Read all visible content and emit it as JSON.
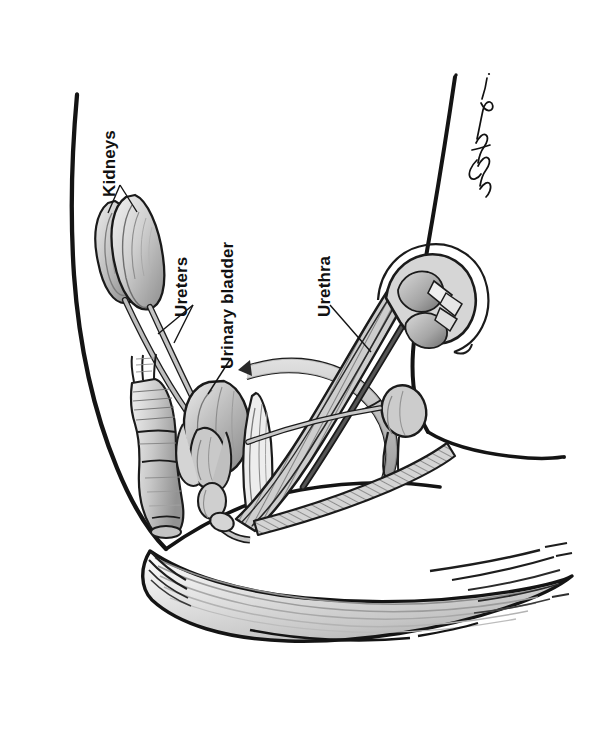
{
  "document": {
    "kind": "anatomical-illustration",
    "subject": "Male canine urinary tract, lateral view",
    "medium": "grayscale pen-and-ink with wash shading",
    "page_background_color": "#ffffff",
    "ink_color": "#111111",
    "scan_border_color": "#080808",
    "page_edge_line_color": "#b9b9b9"
  },
  "labels": [
    {
      "id": "kidneys",
      "text": "Kidneys",
      "rotation_degrees": -90,
      "x": 118,
      "y": 180,
      "font_size_px": 17,
      "leader": "double-branch-v"
    },
    {
      "id": "ureters",
      "text": "Ureters",
      "rotation_degrees": -90,
      "x": 190,
      "y": 300,
      "font_size_px": 17,
      "leader": "double-branch-v"
    },
    {
      "id": "urinary-bladder",
      "text": "Urinary bladder",
      "rotation_degrees": -90,
      "x": 236,
      "y": 352,
      "font_size_px": 17,
      "leader": "single-line"
    },
    {
      "id": "urethra",
      "text": "Urethra",
      "rotation_degrees": -90,
      "x": 333,
      "y": 300,
      "font_size_px": 17,
      "leader": "single-line"
    }
  ],
  "signature": {
    "present": true,
    "description": "handwritten artist signature, rotated, upper right",
    "x": 470,
    "y": 140
  },
  "anatomy_parts": [
    "left-kidney",
    "right-kidney",
    "left-ureter",
    "right-ureter",
    "urinary-bladder",
    "prostate",
    "urethra",
    "penis-shaft",
    "os-penis",
    "glans-penis",
    "bulbus-glandis",
    "testis",
    "body-outline-dorsal",
    "body-outline-ventral",
    "vertebral-column",
    "hindlimb-musculature",
    "tail-musculature"
  ],
  "palette": {
    "outline": "#121212",
    "tissue_light": "#e8e8e8",
    "tissue_mid": "#bdbdbd",
    "tissue_dark": "#8e8e8e",
    "tissue_deep": "#6a6a6a",
    "hatch": "#7d7d7d"
  }
}
